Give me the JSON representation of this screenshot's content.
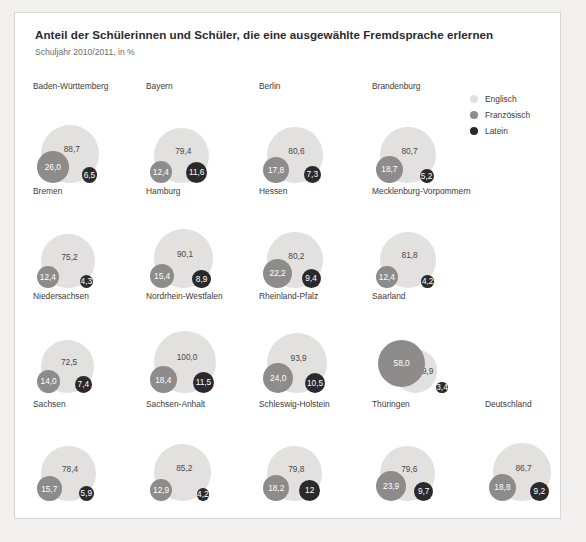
{
  "header": {
    "title": "Anteil der Schülerinnen und Schüler, die eine ausgewählte Fremdsprache erlernen",
    "subtitle": "Schuljahr 2010/2011, in %"
  },
  "legend": {
    "items": [
      {
        "label": "Englisch",
        "color": "#e2e1df"
      },
      {
        "label": "Französisch",
        "color": "#8d8c8a"
      },
      {
        "label": "Latein",
        "color": "#2a2a2c"
      }
    ]
  },
  "chart_data": {
    "type": "bar",
    "title": "Anteil der Schülerinnen und Schüler, die eine ausgewählte Fremdsprache erlernen",
    "subtitle": "Schuljahr 2010/2011, in %",
    "xlabel": "",
    "ylabel": "Anteil in %",
    "ylim": [
      0,
      100
    ],
    "grid": false,
    "legend_position": "right",
    "categories": [
      "Baden-Württemberg",
      "Bayern",
      "Berlin",
      "Brandenburg",
      "Bremen",
      "Hamburg",
      "Hessen",
      "Mecklenburg-Vorpommern",
      "Niedersachsen",
      "Nordrhein-Westfalen",
      "Rheinland-Pfalz",
      "Saarland",
      "Sachsen",
      "Sachsen-Anhalt",
      "Schleswig-Holstein",
      "Thüringen",
      "Deutschland"
    ],
    "series": [
      {
        "name": "Englisch",
        "color": "#e2e1df",
        "values": [
          88.7,
          79.4,
          80.6,
          80.7,
          75.2,
          90.1,
          80.2,
          81.8,
          72.5,
          100.0,
          93.9,
          49.9,
          78.4,
          85.2,
          79.8,
          79.6,
          86.7
        ]
      },
      {
        "name": "Französisch",
        "color": "#8d8c8a",
        "values": [
          26.0,
          12.4,
          17.8,
          18.7,
          12.4,
          15.4,
          22.2,
          12.4,
          14.0,
          18.4,
          24.0,
          58.0,
          15.7,
          12.9,
          18.2,
          23.9,
          18.8
        ]
      },
      {
        "name": "Latein",
        "color": "#2a2a2c",
        "values": [
          6.5,
          11.6,
          7.3,
          5.2,
          4.3,
          8.9,
          9.4,
          4.2,
          7.4,
          11.5,
          10.5,
          3.4,
          5.9,
          4.2,
          12.0,
          9.7,
          9.2
        ]
      }
    ]
  },
  "cells": [
    {
      "name": "Baden-Württemberg",
      "en": "88,7",
      "fr": "26,0",
      "la": "6,5"
    },
    {
      "name": "Bayern",
      "en": "79,4",
      "fr": "12,4",
      "la": "11,6"
    },
    {
      "name": "Berlin",
      "en": "80,6",
      "fr": "17,8",
      "la": "7,3"
    },
    {
      "name": "Brandenburg",
      "en": "80,7",
      "fr": "18,7",
      "la": "5,2"
    },
    {
      "name": "Bremen",
      "en": "75,2",
      "fr": "12,4",
      "la": "4,3"
    },
    {
      "name": "Hamburg",
      "en": "90,1",
      "fr": "15,4",
      "la": "8,9"
    },
    {
      "name": "Hessen",
      "en": "80,2",
      "fr": "22,2",
      "la": "9,4"
    },
    {
      "name": "Mecklenburg-Vorpommern",
      "en": "81,8",
      "fr": "12,4",
      "la": "4,2"
    },
    {
      "name": "Niedersachsen",
      "en": "72,5",
      "fr": "14,0",
      "la": "7,4"
    },
    {
      "name": "Nordrhein-Westfalen",
      "en": "100,0",
      "fr": "18,4",
      "la": "11,5"
    },
    {
      "name": "Rheinland-Pfalz",
      "en": "93,9",
      "fr": "24,0",
      "la": "10,5"
    },
    {
      "name": "Saarland",
      "en": "49,9",
      "fr": "58,0",
      "la": "3,4"
    },
    {
      "name": "Sachsen",
      "en": "78,4",
      "fr": "15,7",
      "la": "5,9"
    },
    {
      "name": "Sachsen-Anhalt",
      "en": "85,2",
      "fr": "12,9",
      "la": "4,2"
    },
    {
      "name": "Schleswig-Holstein",
      "en": "79,8",
      "fr": "18,2",
      "la": "12"
    },
    {
      "name": "Thüringen",
      "en": "79,6",
      "fr": "23,9",
      "la": "9,7"
    },
    {
      "name": "Deutschland",
      "en": "86,7",
      "fr": "18,8",
      "la": "9,2"
    }
  ]
}
